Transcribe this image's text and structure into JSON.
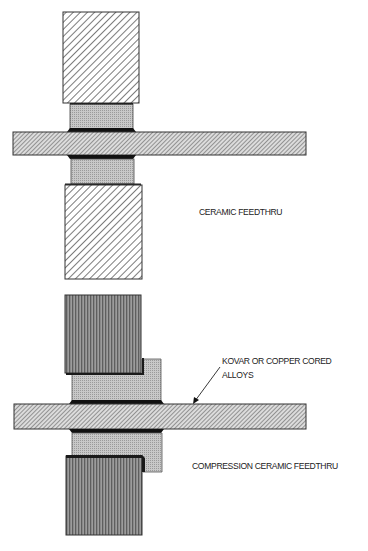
{
  "diagram": {
    "figures": [
      {
        "id": "ceramic-feedthru",
        "caption": "CERAMIC FEEDTHRU",
        "components": [
          "upper-metal-block",
          "upper-ceramic-ring",
          "pin-bar",
          "lower-ceramic-ring",
          "lower-metal-block",
          "braze-joints"
        ]
      },
      {
        "id": "compression-ceramic-feedthru",
        "caption": "COMPRESSION CERAMIC FEEDTHRU",
        "components": [
          "upper-compression-block",
          "upper-stepped-ceramic",
          "pin-bar",
          "lower-stepped-ceramic",
          "lower-compression-block",
          "braze-joints"
        ]
      }
    ],
    "annotations": [
      {
        "lines": [
          "KOVAR OR COPPER CORED",
          "ALLOYS"
        ],
        "points_to": "pin-bar of compression ceramic feedthru"
      }
    ],
    "colors": {
      "hatch_stroke": "#444444",
      "ceramic_fill": "#bcbcbc",
      "compression_block_fill": "#7a7a7a",
      "braze": "#111111",
      "outline": "#333333"
    }
  },
  "labels": {
    "ceramic_feedthru": "CERAMIC FEEDTHRU",
    "kovar_line1": "KOVAR OR COPPER CORED",
    "kovar_line2": "ALLOYS",
    "compression_feedthru": "COMPRESSION CERAMIC FEEDTHRU"
  }
}
